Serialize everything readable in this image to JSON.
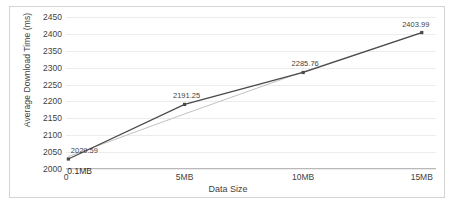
{
  "chart_data": {
    "type": "line",
    "title": "",
    "xlabel": "Data Size",
    "ylabel": "Average Download Time (ms)",
    "x": [
      0.1,
      5,
      10,
      15
    ],
    "x_display": [
      "0.1MB",
      "5MB",
      "10MB",
      "15MB"
    ],
    "values": [
      2029.59,
      2191.25,
      2285.76,
      2403.99
    ],
    "point_labels": [
      "2029.59",
      "2191.25",
      "2285.76",
      "2403.99"
    ],
    "series": [
      {
        "name": "Average Download Time",
        "values": [
          2029.59,
          2191.25,
          2285.76,
          2403.99
        ],
        "color": "#4a4a4a",
        "style": "line-with-markers"
      },
      {
        "name": "Linear trendline",
        "values": [
          2037.0,
          2163.0,
          2288.0,
          2404.0
        ],
        "color": "#c2c2c2",
        "style": "trendline"
      }
    ],
    "xticks": [
      "0",
      "5MB",
      "10MB",
      "15MB"
    ],
    "xtick_values": [
      0,
      5,
      10,
      15
    ],
    "xlim": [
      0,
      15.6
    ],
    "yticks": [
      "2000",
      "2050",
      "2100",
      "2150",
      "2200",
      "2250",
      "2300",
      "2350",
      "2400",
      "2450"
    ],
    "ytick_values": [
      2000,
      2050,
      2100,
      2150,
      2200,
      2250,
      2300,
      2350,
      2400,
      2450
    ],
    "ylim": [
      2000,
      2450
    ],
    "grid": true,
    "grid_color": "#ececec",
    "legend": false,
    "legend_position": "none",
    "annotations": [
      {
        "text": "0.1MB",
        "x": 0.1,
        "y": 2029.59,
        "position": "below-left"
      }
    ],
    "plot_background": "#ffffff",
    "border_color": "#d4d4d4"
  }
}
